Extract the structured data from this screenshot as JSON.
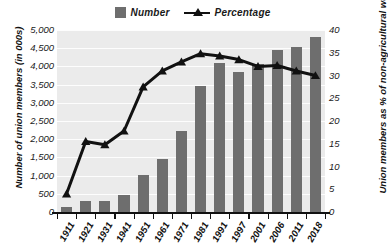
{
  "legend": {
    "items": [
      {
        "label": "Number",
        "marker": "square-swatch-icon",
        "color": "#6e6e6e"
      },
      {
        "label": "Percentage",
        "marker": "line-triangle-icon",
        "color": "#111111"
      }
    ]
  },
  "axes": {
    "left_title": "Number of union members (in 000s)",
    "right_title": "Union members as % of non-agricultural workers",
    "left_ticks": [
      "5,000",
      "4,500",
      "4,000",
      "3,500",
      "3,000",
      "2,500",
      "2,000",
      "1,500",
      "1,000",
      "500",
      "0"
    ],
    "right_ticks": [
      "40",
      "35",
      "30",
      "25",
      "20",
      "15",
      "10",
      "5",
      "0"
    ]
  },
  "chart_data": {
    "type": "bar",
    "title": "",
    "xlabel": "",
    "ylabel": "Number of union members (in 000s)",
    "y2label": "Union members as % of non-agricultural workers",
    "ylim": [
      0,
      5000
    ],
    "y2lim": [
      0,
      40
    ],
    "grid": true,
    "legend_position": "top-center",
    "categories": [
      "1911",
      "1921",
      "1931",
      "1941",
      "1951",
      "1961",
      "1971",
      "1981",
      "1991",
      "1997",
      "2001",
      "2006",
      "2011",
      "2018"
    ],
    "series": [
      {
        "name": "Number",
        "type": "bar",
        "axis": "left",
        "units": "thousands",
        "color": "#6e6e6e",
        "values": [
          130,
          310,
          310,
          460,
          1030,
          1450,
          2230,
          3470,
          4100,
          3850,
          4080,
          4440,
          4540,
          4800
        ]
      },
      {
        "name": "Percentage",
        "type": "line",
        "axis": "right",
        "units": "percent",
        "color": "#111111",
        "marker": "triangle",
        "values": [
          4.0,
          15.5,
          14.8,
          17.8,
          27.5,
          31.0,
          33.0,
          34.8,
          34.3,
          33.5,
          32.0,
          32.2,
          31.0,
          30.0
        ]
      }
    ]
  }
}
